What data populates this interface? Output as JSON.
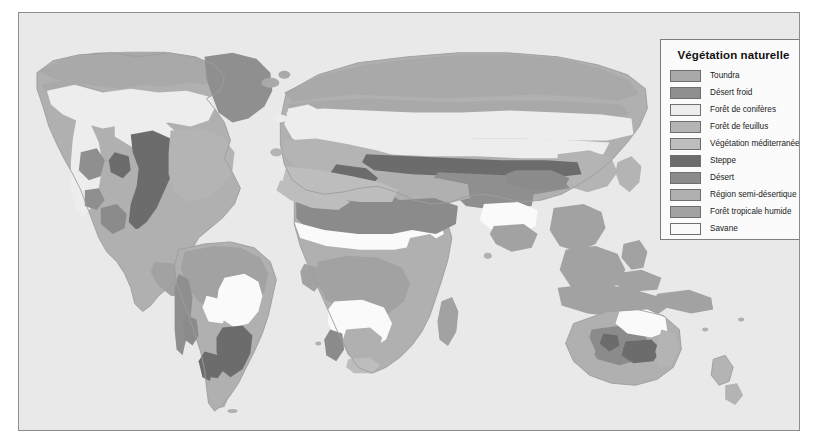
{
  "plate": {
    "background_color": "#e9e9e9",
    "border_color": "#8d8d8d",
    "landmass_outline_color": "#9d9d9d"
  },
  "legend": {
    "title": "Végétation naturelle",
    "background_color": "#fbfbfb",
    "border_color": "#7d7d7d",
    "items": [
      {
        "label": "Toundra",
        "color": "#a9a9a9",
        "key": "toundra"
      },
      {
        "label": "Désert froid",
        "color": "#8f8f8f",
        "key": "desert-froid"
      },
      {
        "label": "Forêt de conifères",
        "color": "#ededed",
        "key": "foret-coniferes"
      },
      {
        "label": "Forêt de feuillus",
        "color": "#b4b4b4",
        "key": "foret-feuillus"
      },
      {
        "label": "Végétation méditerranéenne",
        "color": "#bdbdbd",
        "key": "vegetation-mediterraneenne"
      },
      {
        "label": "Steppe",
        "color": "#6c6c6c",
        "key": "steppe"
      },
      {
        "label": "Désert",
        "color": "#8b8b8b",
        "key": "desert"
      },
      {
        "label": "Région semi-désertique",
        "color": "#b0b0b0",
        "key": "region-semi-desertique"
      },
      {
        "label": "Forêt tropicale humide",
        "color": "#a2a2a2",
        "key": "foret-tropicale-humide"
      },
      {
        "label": "Savane",
        "color": "#fafafa",
        "key": "savane"
      }
    ]
  },
  "map": {
    "projection_note": "world map, natural vegetation zones",
    "regions": [
      "Amérique du Nord",
      "Amérique du Sud",
      "Afrique",
      "Europe",
      "Asie",
      "Australie",
      "Groenland"
    ]
  }
}
